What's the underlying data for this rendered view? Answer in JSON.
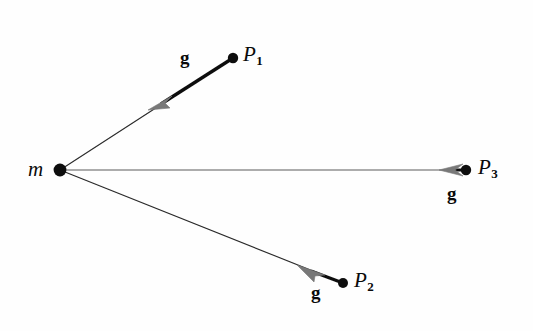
{
  "figure": {
    "type": "vector-diagram",
    "background_color": "#fefefe",
    "ink_color": "#0a0a0a",
    "arrow_color": "#6e6e6e",
    "width": 533,
    "height": 331
  },
  "source": {
    "label": "m",
    "x": 60,
    "y": 170,
    "dot_radius": 6.2,
    "label_x": 28,
    "label_y": 160
  },
  "field_points": [
    {
      "name": "P1",
      "label": "P",
      "subscript": "1",
      "x": 233,
      "y": 58,
      "dot_radius": 5.0,
      "label_x": 243,
      "label_y": 44,
      "vector_label": "g",
      "vector_label_x": 180,
      "vector_label_y": 48,
      "arrow_tip_x": 150,
      "arrow_tip_y": 108,
      "thick_start_x": 233,
      "thick_start_y": 58,
      "thick_end_x": 163,
      "thick_end_y": 103
    },
    {
      "name": "P2",
      "label": "P",
      "subscript": "2",
      "x": 343,
      "y": 283,
      "dot_radius": 5.0,
      "label_x": 353,
      "label_y": 270,
      "vector_label": "g",
      "vector_label_x": 313,
      "vector_label_y": 283,
      "arrow_tip_x": 299,
      "arrow_tip_y": 266,
      "thick_start_x": 343,
      "thick_start_y": 283,
      "thick_end_x": 312,
      "thick_end_y": 271
    },
    {
      "name": "P3",
      "label": "P",
      "subscript": "3",
      "x": 466,
      "y": 170,
      "dot_radius": 5.0,
      "label_x": 477,
      "label_y": 157,
      "vector_label": "g",
      "vector_label_x": 448,
      "vector_label_y": 184,
      "arrow_tip_x": 441,
      "arrow_tip_y": 170,
      "thick_start_x": 466,
      "thick_start_y": 170,
      "thick_end_x": 456,
      "thick_end_y": 170
    }
  ],
  "rays": [
    {
      "name": "ray-m-to-p1",
      "x1": 60,
      "y1": 170,
      "x2": 233,
      "y2": 58
    },
    {
      "name": "ray-m-to-p2",
      "x1": 60,
      "y1": 170,
      "x2": 343,
      "y2": 283
    },
    {
      "name": "ray-m-to-p3",
      "x1": 60,
      "y1": 170,
      "x2": 466,
      "y2": 170
    }
  ]
}
